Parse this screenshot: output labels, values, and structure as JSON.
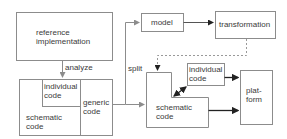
{
  "diagram": {
    "nodes": {
      "reference": {
        "label_line1": "reference",
        "label_line2": "implementation"
      },
      "individual_left": {
        "label_line1": "individual",
        "label_line2": "code"
      },
      "generic": {
        "label_line1": "generic",
        "label_line2": "code"
      },
      "schematic_left": {
        "label_line1": "schematic",
        "label_line2": "code"
      },
      "model": {
        "label": "model"
      },
      "transformation": {
        "label": "transformation"
      },
      "individual_right": {
        "label_line1": "individual",
        "label_line2": "code"
      },
      "schematic_right": {
        "label_line1": "schematic",
        "label_line2": "code"
      },
      "platform": {
        "label_line1": "plat-",
        "label_line2": "form"
      }
    },
    "edges": {
      "analyze": "analyze",
      "split": "split"
    },
    "colors": {
      "box_stroke": "#8c8c8c",
      "arrow_light": "#8c8c8c",
      "arrow_dark": "#222222",
      "dashed": "#999999"
    }
  }
}
